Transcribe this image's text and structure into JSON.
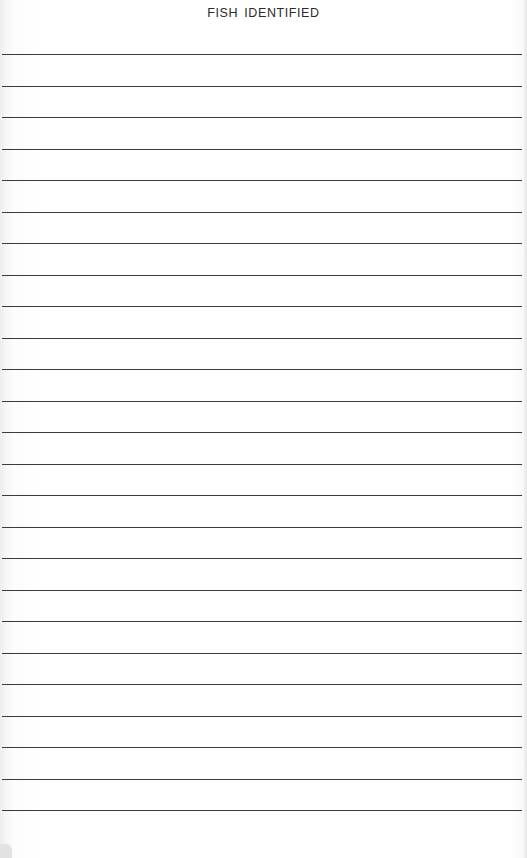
{
  "document": {
    "title": "FISH IDENTIFIED",
    "ruled_lines": {
      "count": 25,
      "first_y": 54,
      "spacing": 31.5,
      "color": "#3a3a3a"
    }
  }
}
